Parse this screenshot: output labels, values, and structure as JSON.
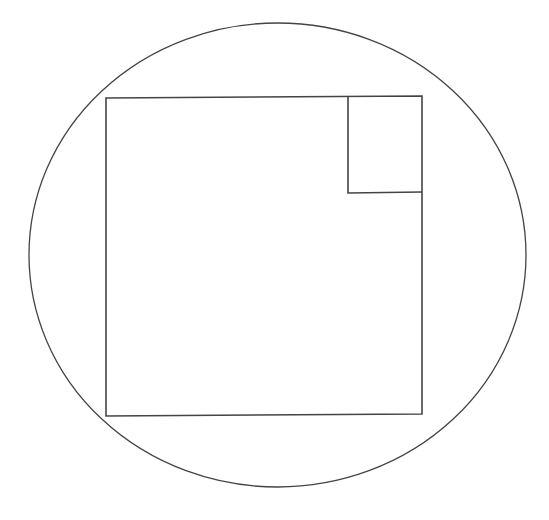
{
  "diagram": {
    "background": "#ffffff",
    "stroke_color": "#444444",
    "circle": {
      "cx": 277.5,
      "cy": 255,
      "rx": 248.5,
      "ry": 232,
      "stroke_width": 1.3
    },
    "outer_square": {
      "points": "106,98 422,96 422,414 106,416",
      "stroke_width": 1.6
    },
    "inner_square": {
      "points": "348,96 348,193 422,192",
      "stroke_width": 1.6
    }
  }
}
